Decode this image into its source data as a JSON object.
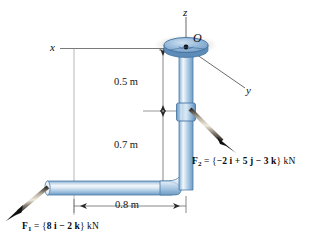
{
  "figure": {
    "axes": {
      "z_label": "z",
      "x_label": "x",
      "y_label": "y",
      "origin_label": "O"
    },
    "dimensions": [
      {
        "id": "upper-vertical",
        "label": "0.5 m",
        "value": 0.5,
        "unit": "m"
      },
      {
        "id": "lower-vertical",
        "label": "0.7 m",
        "value": 0.7,
        "unit": "m"
      },
      {
        "id": "horizontal-run",
        "label": "0.8 m",
        "value": 0.8,
        "unit": "m"
      }
    ],
    "forces": [
      {
        "id": "F1",
        "name": "F",
        "subscript": "1",
        "equals": "=",
        "open": "{",
        "components": "8 i − 2 k",
        "close": "}",
        "unit": "kN",
        "full_label": "F₁ = {8 i − 2 k} kN"
      },
      {
        "id": "F2",
        "name": "F",
        "subscript": "2",
        "equals": "=",
        "open": "{",
        "components": "−2 i + 5 j − 3 k",
        "close": "}",
        "unit": "kN",
        "full_label": "F₂ = {−2 i + 5 j − 3 k} kN"
      }
    ],
    "colors": {
      "pipe_light": "#dbe8f4",
      "pipe_mid": "#a9c6e2",
      "pipe_dark": "#6f9cc4",
      "pipe_edge": "#4d7ba6",
      "flange_top": "#8fb4d6",
      "flange_side": "#5d8cb8",
      "line": "#5a5a5a",
      "arrow": "#111111",
      "text": "#0d0d0d",
      "shadow": "#cfc9c2"
    }
  }
}
